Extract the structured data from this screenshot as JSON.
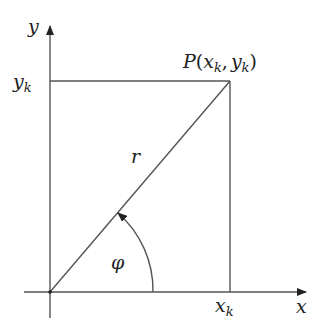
{
  "diagram": {
    "axes": {
      "x_label": "x",
      "y_label": "y"
    },
    "point": {
      "name": "P",
      "open": "(",
      "x_main": "x",
      "x_sub": "k",
      "sep": ",",
      "y_main": "y",
      "y_sub": "k",
      "close": ")"
    },
    "ticks": {
      "x_tick": {
        "main": "x",
        "sub": "k"
      },
      "y_tick": {
        "main": "y",
        "sub": "k"
      }
    },
    "radius_label": "r",
    "angle_label": "φ",
    "colors": {
      "line": "#555555",
      "text": "#222222",
      "background": "#ffffff"
    }
  }
}
